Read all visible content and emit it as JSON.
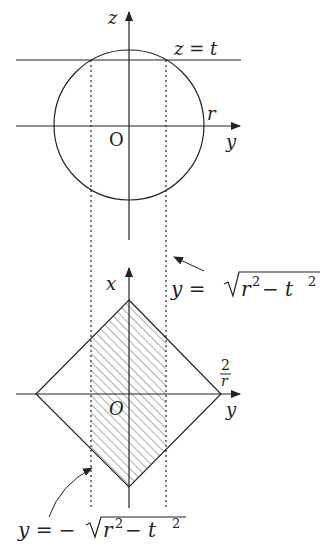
{
  "top_diagram": {
    "axis_z": "z",
    "axis_y": "y",
    "origin": "O",
    "radius_label": "r",
    "plane_label": "z = t"
  },
  "bottom_diagram": {
    "axis_x": "x",
    "axis_y": "y",
    "origin": "O",
    "vertex_label_num": "2",
    "vertex_label_den": "r",
    "upper_bound_label": "y = √r² − t²",
    "lower_bound_label": "y = −√r² − t²",
    "upper_eq": {
      "lhs": "y = ",
      "rad": "r",
      "sup1": "2",
      "mid": " − t",
      "sup2": "2"
    },
    "lower_eq": {
      "lhs": "y = −",
      "rad": "r",
      "sup1": "2",
      "mid": " − t",
      "sup2": "2"
    }
  },
  "colors": {
    "ink": "#222222",
    "background": "#ffffff"
  }
}
